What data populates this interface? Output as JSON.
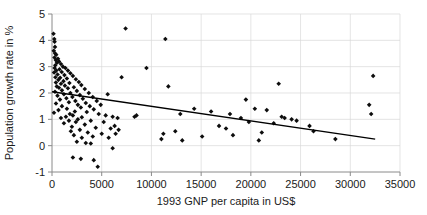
{
  "chart_data": {
    "type": "scatter",
    "title": "",
    "xlabel": "1993 GNP per capita in US$",
    "ylabel": "Population growth rate in %",
    "xlim": [
      0,
      35000
    ],
    "ylim": [
      -1,
      5
    ],
    "xticks": [
      0,
      5000,
      10000,
      15000,
      20000,
      25000,
      30000,
      35000
    ],
    "xtick_labels": [
      "0",
      "5000",
      "10000",
      "15000",
      "20000",
      "25000",
      "30000",
      "35000"
    ],
    "yticks": [
      -1,
      0,
      1,
      2,
      3,
      4,
      5
    ],
    "ytick_labels": [
      "-1",
      "0",
      "1",
      "2",
      "3",
      "4",
      "5"
    ],
    "grid": true,
    "legend": "none",
    "marker": "diamond",
    "marker_color": "#0d0d0d",
    "trendline": {
      "type": "linear",
      "color": "#000000",
      "x_start": 0,
      "y_start": 2.05,
      "x_end": 32500,
      "y_end": 0.25
    },
    "points": [
      [
        150,
        4.25
      ],
      [
        230,
        4.05
      ],
      [
        260,
        3.95
      ],
      [
        300,
        3.75
      ],
      [
        180,
        3.6
      ],
      [
        320,
        3.5
      ],
      [
        420,
        3.45
      ],
      [
        250,
        3.35
      ],
      [
        600,
        3.3
      ],
      [
        380,
        3.25
      ],
      [
        700,
        3.2
      ],
      [
        500,
        3.15
      ],
      [
        900,
        3.1
      ],
      [
        330,
        3.05
      ],
      [
        1100,
        3.0
      ],
      [
        260,
        2.95
      ],
      [
        1350,
        2.95
      ],
      [
        750,
        2.9
      ],
      [
        430,
        2.85
      ],
      [
        1600,
        2.85
      ],
      [
        980,
        2.8
      ],
      [
        210,
        2.78
      ],
      [
        1850,
        2.75
      ],
      [
        560,
        2.7
      ],
      [
        1250,
        2.68
      ],
      [
        2100,
        2.65
      ],
      [
        340,
        2.6
      ],
      [
        820,
        2.58
      ],
      [
        1500,
        2.55
      ],
      [
        2400,
        2.52
      ],
      [
        640,
        2.5
      ],
      [
        1150,
        2.45
      ],
      [
        2700,
        2.42
      ],
      [
        390,
        2.4
      ],
      [
        1750,
        2.38
      ],
      [
        900,
        2.35
      ],
      [
        2950,
        2.3
      ],
      [
        1300,
        2.28
      ],
      [
        480,
        2.25
      ],
      [
        2200,
        2.22
      ],
      [
        700,
        2.2
      ],
      [
        1600,
        2.18
      ],
      [
        3300,
        2.15
      ],
      [
        1000,
        2.1
      ],
      [
        2500,
        2.08
      ],
      [
        300,
        2.05
      ],
      [
        1850,
        2.0
      ],
      [
        3700,
        2.0
      ],
      [
        1200,
        1.95
      ],
      [
        2800,
        1.92
      ],
      [
        550,
        1.9
      ],
      [
        2050,
        1.85
      ],
      [
        4100,
        1.85
      ],
      [
        1450,
        1.8
      ],
      [
        3100,
        1.78
      ],
      [
        800,
        1.75
      ],
      [
        2350,
        1.7
      ],
      [
        4500,
        1.7
      ],
      [
        1700,
        1.65
      ],
      [
        3400,
        1.62
      ],
      [
        400,
        1.6
      ],
      [
        2600,
        1.55
      ],
      [
        1000,
        1.5
      ],
      [
        3800,
        1.5
      ],
      [
        2900,
        1.45
      ],
      [
        1500,
        1.4
      ],
      [
        4200,
        1.38
      ],
      [
        650,
        1.35
      ],
      [
        2300,
        1.3
      ],
      [
        3500,
        1.28
      ],
      [
        200,
        1.25
      ],
      [
        1800,
        1.2
      ],
      [
        4700,
        1.2
      ],
      [
        2100,
        1.15
      ],
      [
        5400,
        1.15
      ],
      [
        1400,
        1.1
      ],
      [
        3000,
        1.08
      ],
      [
        6100,
        1.1
      ],
      [
        900,
        1.05
      ],
      [
        2600,
        1.0
      ],
      [
        6600,
        1.05
      ],
      [
        1700,
        0.95
      ],
      [
        3900,
        0.95
      ],
      [
        8500,
        1.15
      ],
      [
        2400,
        0.9
      ],
      [
        5200,
        0.9
      ],
      [
        1200,
        0.85
      ],
      [
        3300,
        0.8
      ],
      [
        6300,
        0.75
      ],
      [
        2000,
        0.72
      ],
      [
        4400,
        0.68
      ],
      [
        5900,
        0.65
      ],
      [
        2800,
        0.6
      ],
      [
        6700,
        0.6
      ],
      [
        1900,
        0.55
      ],
      [
        3600,
        0.5
      ],
      [
        5000,
        0.45
      ],
      [
        6400,
        0.45
      ],
      [
        2200,
        0.4
      ],
      [
        4100,
        0.35
      ],
      [
        3000,
        0.3
      ],
      [
        5700,
        0.3
      ],
      [
        2500,
        0.15
      ],
      [
        3400,
        0.1
      ],
      [
        3900,
        0.08
      ],
      [
        6100,
        -0.1
      ],
      [
        2100,
        -0.45
      ],
      [
        2900,
        -0.5
      ],
      [
        4200,
        -0.55
      ],
      [
        4600,
        -0.8
      ],
      [
        11000,
        0.25
      ],
      [
        11200,
        0.45
      ],
      [
        12400,
        0.55
      ],
      [
        12900,
        1.2
      ],
      [
        11400,
        4.05
      ],
      [
        8300,
        1.1
      ],
      [
        11700,
        2.25
      ],
      [
        9500,
        2.95
      ],
      [
        7400,
        4.45
      ],
      [
        14300,
        1.4
      ],
      [
        15100,
        0.35
      ],
      [
        16800,
        0.75
      ],
      [
        17500,
        0.65
      ],
      [
        18200,
        0.4
      ],
      [
        19000,
        1.05
      ],
      [
        19800,
        0.9
      ],
      [
        20400,
        1.4
      ],
      [
        21100,
        0.5
      ],
      [
        21600,
        1.35
      ],
      [
        22300,
        0.85
      ],
      [
        22800,
        2.35
      ],
      [
        23100,
        1.1
      ],
      [
        23400,
        1.05
      ],
      [
        24100,
        1.0
      ],
      [
        24600,
        0.95
      ],
      [
        25900,
        0.75
      ],
      [
        19500,
        1.75
      ],
      [
        26300,
        0.55
      ],
      [
        31900,
        1.55
      ],
      [
        32100,
        1.2
      ],
      [
        32300,
        2.65
      ],
      [
        28500,
        0.25
      ],
      [
        13100,
        0.2
      ],
      [
        16000,
        1.3
      ],
      [
        17900,
        1.2
      ],
      [
        20800,
        0.2
      ],
      [
        7000,
        2.6
      ],
      [
        5600,
        1.95
      ],
      [
        4900,
        1.55
      ]
    ]
  }
}
